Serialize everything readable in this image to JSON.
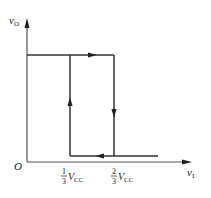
{
  "diagram": {
    "type": "hysteresis-transfer-characteristic",
    "y_axis_label": "v",
    "y_axis_sub": "O",
    "x_axis_label": "v",
    "x_axis_sub": "I",
    "origin_label": "O",
    "tick_low": {
      "num": "1",
      "den": "3",
      "var": "V",
      "sub": "CC"
    },
    "tick_high": {
      "num": "2",
      "den": "3",
      "var": "V",
      "sub": "CC"
    },
    "colors": {
      "line": "#333333",
      "axis": "#555555"
    },
    "loop": {
      "top_level": "high",
      "bottom_level": "low",
      "rising_threshold": "2/3 VCC",
      "falling_threshold": "1/3 VCC",
      "arrows": [
        "right on top",
        "down at 2/3 VCC",
        "left on bottom",
        "up at 1/3 VCC"
      ]
    }
  }
}
